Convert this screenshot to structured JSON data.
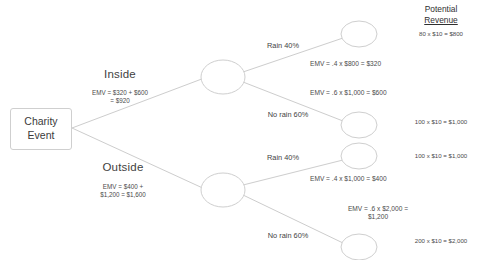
{
  "diagram": {
    "title_column": {
      "line1": "Potential",
      "line2": "Revenue"
    },
    "root": {
      "label_line1": "Charity",
      "label_line2": "Event"
    },
    "branches": [
      {
        "name": "Inside",
        "emv_line1": "EMV = $320 + $600",
        "emv_line2": "= $920",
        "outcomes": [
          {
            "probability_label": "Rain 40%",
            "emv_line1": "EMV = .4 x $800 = $320",
            "emv_line2": "",
            "revenue": "80 x $10 = $800"
          },
          {
            "probability_label": "No rain 60%",
            "emv_line1": "EMV = .6 x $1,000 = $600",
            "emv_line2": "",
            "revenue": "100 x $10 = $1,000"
          }
        ]
      },
      {
        "name": "Outside",
        "emv_line1": "EMV = $400 +",
        "emv_line2": "$1,200 = $1,600",
        "outcomes": [
          {
            "probability_label": "Rain 40%",
            "emv_line1": "EMV = .4 x $1,000 = $400",
            "emv_line2": "",
            "revenue": "100 x $10 = $1,000"
          },
          {
            "probability_label": "No rain 60%",
            "emv_line1": "EMV = .6 x $2,000 =",
            "emv_line2": "$1,200",
            "revenue": "200 x $10 = $2,000"
          }
        ]
      }
    ],
    "colors": {
      "line": "#cdcdcd",
      "node_stroke": "#cfcfcf",
      "text": "#3b3b3b"
    }
  }
}
